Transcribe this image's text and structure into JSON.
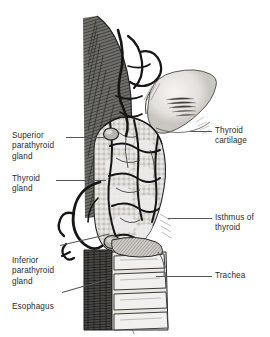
{
  "figure": {
    "background_color": "#ffffff",
    "leader_color": "#55555a",
    "text_color": "#2b2b2b"
  },
  "labels": {
    "superior_parathyroid": "Superior\nparathyroid\ngland",
    "thyroid_gland": "Thyroid\ngland",
    "inferior_parathyroid": "Inferior\nparathyroid\ngland",
    "esophagus": "Esophagus",
    "thyroid_cartilage": "Thyroid\ncartilage",
    "isthmus": "Isthmus of\nthyroid",
    "trachea": "Trachea"
  },
  "structures": {
    "muscle": "strap-muscle-hatching",
    "vessels": "thyroid-arteries-and-veins",
    "cartilage": "thyroid-cartilage-shield",
    "gland": "lobulated-thyroid-gland",
    "trachea": "tracheal-cartilage-rings",
    "esophagus": "esophagus-dark-band",
    "parathyroid_superior": "superior-parathyroid-nodule",
    "parathyroid_inferior": "inferior-parathyroid-nodule"
  },
  "colors": {
    "ink": "#2b2b2b",
    "gland_fill": "#d8d6d4",
    "cartilage_fill": "#ece9e6",
    "muscle_dark": "#4a4845",
    "esophagus_dark": "#3a3836",
    "vessel": "#1c1b1a"
  }
}
